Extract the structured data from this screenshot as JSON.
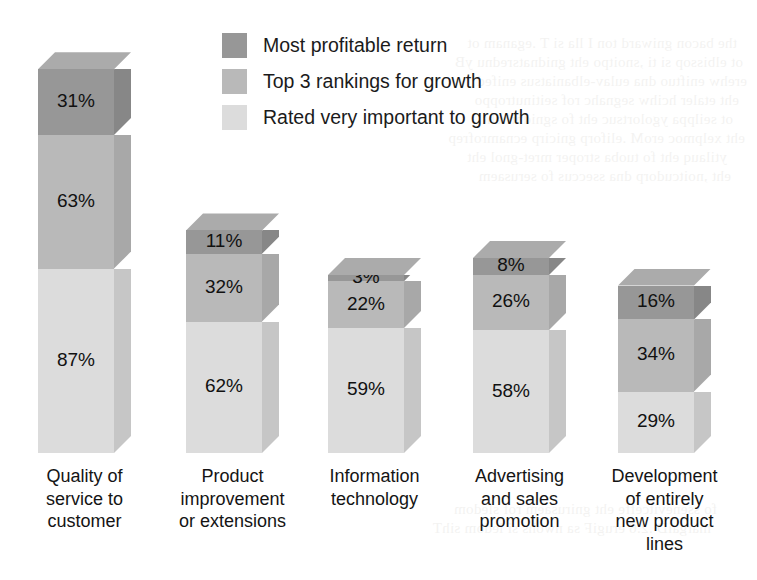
{
  "legend": {
    "position": "top-center",
    "items": [
      {
        "label": "Most profitable return",
        "color": "#979797",
        "swatch_name": "legend-swatch-dark"
      },
      {
        "label": "Top 3 rankings for growth",
        "color": "#b9b9b9",
        "swatch_name": "legend-swatch-mid"
      },
      {
        "label": "Rated very important to growth",
        "color": "#dcdcdc",
        "swatch_name": "legend-swatch-light"
      }
    ]
  },
  "colors": {
    "series_dark_front": "#979797",
    "series_dark_side": "#878787",
    "series_dark_top": "#ababab",
    "series_mid_front": "#b9b9b9",
    "series_mid_side": "#a8a8a8",
    "series_mid_top": "#c9c9c9",
    "series_light_front": "#dcdcdc",
    "series_light_side": "#c6c6c6",
    "series_light_top": "#e8e8e8",
    "background": "#ffffff",
    "text": "#141414"
  },
  "chart_data": {
    "type": "bar",
    "subtype": "stacked-3d-column",
    "title": "",
    "subtitle": "",
    "xlabel": "",
    "ylabel": "",
    "grid": false,
    "legend_position": "top-center",
    "units": "percent",
    "ylim": [
      0,
      185
    ],
    "categories": [
      "Quality of service to customer",
      "Product improvement or extensions",
      "Information technology",
      "Advertising and sales promotion",
      "Development of entirely new product lines"
    ],
    "category_label_lines": [
      [
        "Quality of",
        "service to",
        "customer"
      ],
      [
        "Product",
        "improvement",
        "or extensions"
      ],
      [
        "Information",
        "technology"
      ],
      [
        "Advertising",
        "and sales",
        "promotion"
      ],
      [
        "Development",
        "of entirely",
        "new product",
        "lines"
      ]
    ],
    "series": [
      {
        "name": "Rated very important to growth",
        "color": "#dcdcdc",
        "values": [
          87,
          62,
          59,
          58,
          29
        ],
        "labels": [
          "87%",
          "62%",
          "59%",
          "58%",
          "29%"
        ]
      },
      {
        "name": "Top 3 rankings for growth",
        "color": "#b9b9b9",
        "values": [
          63,
          32,
          22,
          26,
          34
        ],
        "labels": [
          "63%",
          "32%",
          "22%",
          "26%",
          "34%"
        ]
      },
      {
        "name": "Most profitable return",
        "color": "#979797",
        "values": [
          31,
          11,
          3,
          8,
          16
        ],
        "labels": [
          "31%",
          "11%",
          "3%",
          "8%",
          "16%"
        ]
      }
    ],
    "totals": [
      181,
      105,
      84,
      92,
      79
    ]
  }
}
